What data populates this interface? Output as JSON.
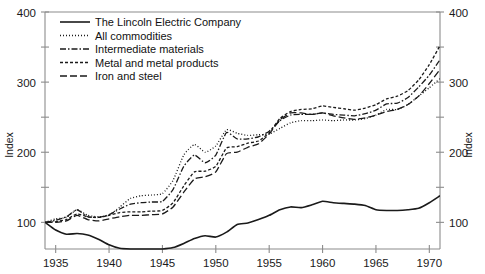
{
  "chart_data": {
    "type": "line",
    "title": "",
    "xlabel": "",
    "ylabel": "Index",
    "ylabel_right": "Index",
    "xlim": [
      1934,
      1971
    ],
    "ylim": [
      62,
      400
    ],
    "yticks_major": [
      100,
      200,
      300,
      400
    ],
    "yticks_minor": [
      150,
      250,
      350
    ],
    "ytick_labels": [
      "100",
      "200",
      "300",
      "400"
    ],
    "xticks": [
      1935,
      1940,
      1945,
      1950,
      1955,
      1960,
      1965,
      1970
    ],
    "xtick_labels": [
      "1935",
      "1940",
      "1945",
      "1950",
      "1955",
      "1960",
      "1965",
      "1970"
    ],
    "grid": false,
    "legend_position": "top-left",
    "x": [
      1934,
      1935,
      1936,
      1937,
      1938,
      1939,
      1940,
      1941,
      1942,
      1943,
      1944,
      1945,
      1946,
      1947,
      1948,
      1949,
      1950,
      1951,
      1952,
      1953,
      1954,
      1955,
      1956,
      1957,
      1958,
      1959,
      1960,
      1961,
      1962,
      1963,
      1964,
      1965,
      1966,
      1967,
      1968,
      1969,
      1970,
      1971
    ],
    "series": [
      {
        "name": "The Lincoln Electric Company",
        "dash": "solid",
        "values": [
          100,
          89,
          83,
          84,
          82,
          76,
          68,
          63,
          62,
          62,
          62,
          62,
          64,
          70,
          77,
          81,
          79,
          86,
          97,
          99,
          104,
          110,
          118,
          122,
          121,
          125,
          130,
          128,
          127,
          126,
          124,
          118,
          117,
          117,
          118,
          120,
          128,
          138
        ]
      },
      {
        "name": "All commodities",
        "dash": "dotted",
        "values": [
          100,
          105,
          107,
          118,
          110,
          108,
          110,
          122,
          134,
          138,
          139,
          141,
          160,
          196,
          211,
          200,
          209,
          232,
          227,
          224,
          225,
          226,
          234,
          242,
          245,
          245,
          246,
          245,
          246,
          246,
          248,
          253,
          261,
          261,
          268,
          280,
          292,
          305
        ]
      },
      {
        "name": "Intermediate materials",
        "dash": "dashdot",
        "values": [
          100,
          103,
          108,
          118,
          108,
          107,
          111,
          119,
          126,
          128,
          129,
          130,
          147,
          180,
          196,
          185,
          196,
          228,
          219,
          219,
          222,
          230,
          245,
          253,
          254,
          254,
          256,
          254,
          253,
          252,
          255,
          260,
          269,
          270,
          278,
          293,
          310,
          332
        ]
      },
      {
        "name": "Metal and metal products",
        "dash": "dashed-short",
        "values": [
          100,
          101,
          104,
          112,
          108,
          107,
          110,
          114,
          115,
          115,
          116,
          117,
          128,
          152,
          172,
          173,
          180,
          206,
          208,
          213,
          216,
          228,
          248,
          258,
          261,
          262,
          266,
          264,
          262,
          260,
          263,
          268,
          276,
          280,
          288,
          303,
          325,
          352
        ]
      },
      {
        "name": "Iron and steel",
        "dash": "dashed-long",
        "values": [
          100,
          100,
          102,
          110,
          104,
          102,
          105,
          108,
          110,
          110,
          111,
          112,
          122,
          143,
          162,
          165,
          172,
          198,
          200,
          207,
          212,
          226,
          246,
          256,
          256,
          254,
          256,
          252,
          249,
          247,
          249,
          253,
          258,
          261,
          268,
          280,
          298,
          318
        ]
      }
    ]
  },
  "legend": {
    "items": [
      {
        "label": "The Lincoln Electric Company",
        "style": "solid"
      },
      {
        "label": "All commodities",
        "style": "dotted"
      },
      {
        "label": "Intermediate materials",
        "style": "dashdot"
      },
      {
        "label": "Metal and metal products",
        "style": "dashed-short"
      },
      {
        "label": "Iron and steel",
        "style": "dashed-long"
      }
    ]
  },
  "axes": {
    "left_title": "Index",
    "right_title": "Index"
  },
  "colors": {
    "line": "#1a1a1a",
    "axis": "#8c8c8c",
    "text": "#111111",
    "background": "#ffffff"
  }
}
